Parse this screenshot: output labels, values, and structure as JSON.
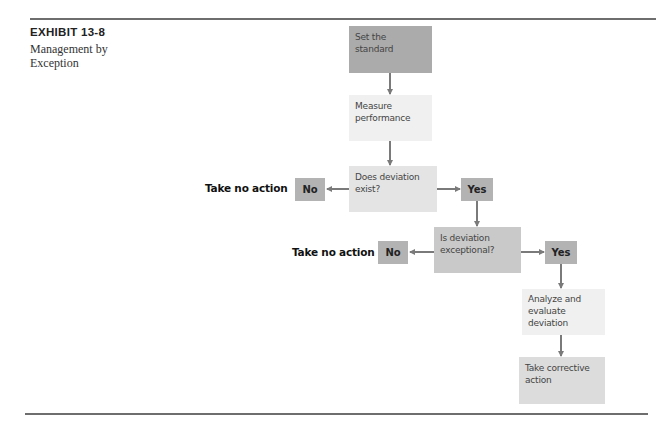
{
  "exhibit": {
    "number": "EXHIBIT 13-8",
    "title": "Management by Exception"
  },
  "flow": {
    "set_standard": "Set the standard",
    "measure": "Measure performance",
    "deviation_exists": "Does deviation exist?",
    "no_1": "No",
    "yes_1": "Yes",
    "take_no_action_1": "Take no action",
    "deviation_exceptional": "Is deviation exceptional?",
    "no_2": "No",
    "yes_2": "Yes",
    "take_no_action_2": "Take no action",
    "analyze": "Analyze and evaluate deviation",
    "corrective": "Take corrective action"
  }
}
